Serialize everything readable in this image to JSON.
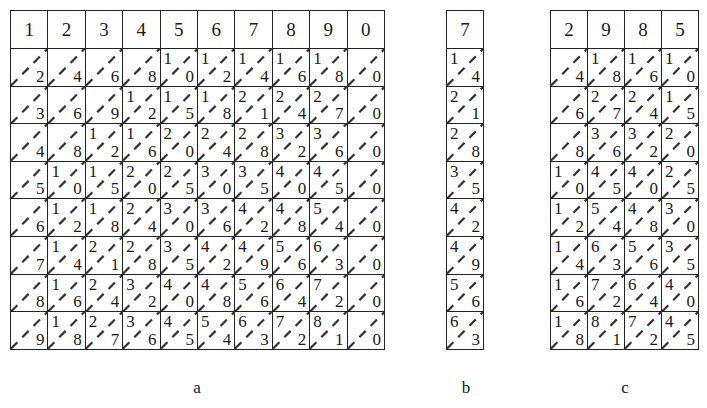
{
  "figure": {
    "panels": [
      {
        "id": "a",
        "caption": "a",
        "headers": [
          "1",
          "2",
          "3",
          "4",
          "5",
          "6",
          "7",
          "8",
          "9",
          "0"
        ],
        "rows": [
          [
            [
              "",
              "2"
            ],
            [
              "",
              "4"
            ],
            [
              "",
              "6"
            ],
            [
              "",
              "8"
            ],
            [
              "1",
              "0"
            ],
            [
              "1",
              "2"
            ],
            [
              "1",
              "4"
            ],
            [
              "1",
              "6"
            ],
            [
              "1",
              "8"
            ],
            [
              "",
              "0"
            ]
          ],
          [
            [
              "",
              "3"
            ],
            [
              "",
              "6"
            ],
            [
              "",
              "9"
            ],
            [
              "1",
              "2"
            ],
            [
              "1",
              "5"
            ],
            [
              "1",
              "8"
            ],
            [
              "2",
              "1"
            ],
            [
              "2",
              "4"
            ],
            [
              "2",
              "7"
            ],
            [
              "",
              "0"
            ]
          ],
          [
            [
              "",
              "4"
            ],
            [
              "",
              "8"
            ],
            [
              "1",
              "2"
            ],
            [
              "1",
              "6"
            ],
            [
              "2",
              "0"
            ],
            [
              "2",
              "4"
            ],
            [
              "2",
              "8"
            ],
            [
              "3",
              "2"
            ],
            [
              "3",
              "6"
            ],
            [
              "",
              "0"
            ]
          ],
          [
            [
              "",
              "5"
            ],
            [
              "1",
              "0"
            ],
            [
              "1",
              "5"
            ],
            [
              "2",
              "0"
            ],
            [
              "2",
              "5"
            ],
            [
              "3",
              "0"
            ],
            [
              "3",
              "5"
            ],
            [
              "4",
              "0"
            ],
            [
              "4",
              "5"
            ],
            [
              "",
              "0"
            ]
          ],
          [
            [
              "",
              "6"
            ],
            [
              "1",
              "2"
            ],
            [
              "1",
              "8"
            ],
            [
              "2",
              "4"
            ],
            [
              "3",
              "0"
            ],
            [
              "3",
              "6"
            ],
            [
              "4",
              "2"
            ],
            [
              "4",
              "8"
            ],
            [
              "5",
              "4"
            ],
            [
              "",
              "0"
            ]
          ],
          [
            [
              "",
              "7"
            ],
            [
              "1",
              "4"
            ],
            [
              "2",
              "1"
            ],
            [
              "2",
              "8"
            ],
            [
              "3",
              "5"
            ],
            [
              "4",
              "2"
            ],
            [
              "4",
              "9"
            ],
            [
              "5",
              "6"
            ],
            [
              "6",
              "3"
            ],
            [
              "",
              "0"
            ]
          ],
          [
            [
              "",
              "8"
            ],
            [
              "1",
              "6"
            ],
            [
              "2",
              "4"
            ],
            [
              "3",
              "2"
            ],
            [
              "4",
              "0"
            ],
            [
              "4",
              "8"
            ],
            [
              "5",
              "6"
            ],
            [
              "6",
              "4"
            ],
            [
              "7",
              "2"
            ],
            [
              "",
              "0"
            ]
          ],
          [
            [
              "",
              "9"
            ],
            [
              "1",
              "8"
            ],
            [
              "2",
              "7"
            ],
            [
              "3",
              "6"
            ],
            [
              "4",
              "5"
            ],
            [
              "5",
              "4"
            ],
            [
              "6",
              "3"
            ],
            [
              "7",
              "2"
            ],
            [
              "8",
              "1"
            ],
            [
              "",
              "0"
            ]
          ]
        ]
      },
      {
        "id": "b",
        "caption": "b",
        "headers": [
          "7"
        ],
        "rows": [
          [
            [
              "1",
              "4"
            ]
          ],
          [
            [
              "2",
              "1"
            ]
          ],
          [
            [
              "2",
              "8"
            ]
          ],
          [
            [
              "3",
              "5"
            ]
          ],
          [
            [
              "4",
              "2"
            ]
          ],
          [
            [
              "4",
              "9"
            ]
          ],
          [
            [
              "5",
              "6"
            ]
          ],
          [
            [
              "6",
              "3"
            ]
          ]
        ]
      },
      {
        "id": "c",
        "caption": "c",
        "headers": [
          "2",
          "9",
          "8",
          "5"
        ],
        "rows": [
          [
            [
              "",
              "4"
            ],
            [
              "1",
              "8"
            ],
            [
              "1",
              "6"
            ],
            [
              "1",
              "0"
            ]
          ],
          [
            [
              "",
              "6"
            ],
            [
              "2",
              "7"
            ],
            [
              "2",
              "4"
            ],
            [
              "1",
              "5"
            ]
          ],
          [
            [
              "",
              "8"
            ],
            [
              "3",
              "6"
            ],
            [
              "3",
              "2"
            ],
            [
              "2",
              "0"
            ]
          ],
          [
            [
              "1",
              "0"
            ],
            [
              "4",
              "5"
            ],
            [
              "4",
              "0"
            ],
            [
              "2",
              "5"
            ]
          ],
          [
            [
              "1",
              "2"
            ],
            [
              "5",
              "4"
            ],
            [
              "4",
              "8"
            ],
            [
              "3",
              "0"
            ]
          ],
          [
            [
              "1",
              "4"
            ],
            [
              "6",
              "3"
            ],
            [
              "5",
              "6"
            ],
            [
              "3",
              "5"
            ]
          ],
          [
            [
              "1",
              "6"
            ],
            [
              "7",
              "2"
            ],
            [
              "6",
              "4"
            ],
            [
              "4",
              "0"
            ]
          ],
          [
            [
              "1",
              "8"
            ],
            [
              "8",
              "1"
            ],
            [
              "7",
              "2"
            ],
            [
              "4",
              "5"
            ]
          ]
        ]
      }
    ],
    "colors": {
      "line": "#222222",
      "text": "#1a1a1a",
      "background": "#ffffff"
    }
  }
}
